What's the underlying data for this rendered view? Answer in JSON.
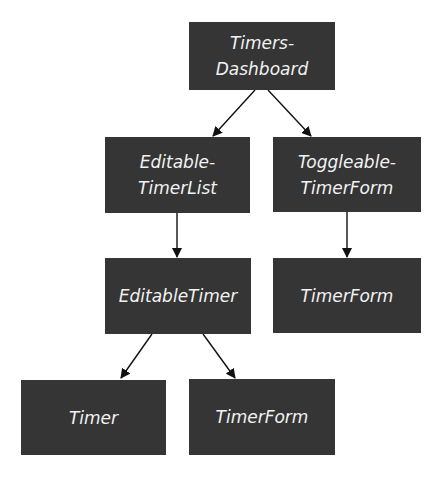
{
  "diagram": {
    "type": "component-hierarchy",
    "nodes": [
      {
        "id": "timers-dashboard",
        "lines": [
          "Timers-",
          "Dashboard"
        ]
      },
      {
        "id": "editable-timer-list",
        "lines": [
          "Editable-",
          "TimerList"
        ]
      },
      {
        "id": "toggleable-timer-form",
        "lines": [
          "Toggleable-",
          "TimerForm"
        ]
      },
      {
        "id": "editable-timer",
        "lines": [
          "EditableTimer"
        ]
      },
      {
        "id": "timer-form-top",
        "lines": [
          "TimerForm"
        ]
      },
      {
        "id": "timer",
        "lines": [
          "Timer"
        ]
      },
      {
        "id": "timer-form-bottom",
        "lines": [
          "TimerForm"
        ]
      }
    ],
    "edges": [
      {
        "from": "timers-dashboard",
        "to": "editable-timer-list"
      },
      {
        "from": "timers-dashboard",
        "to": "toggleable-timer-form"
      },
      {
        "from": "editable-timer-list",
        "to": "editable-timer"
      },
      {
        "from": "toggleable-timer-form",
        "to": "timer-form-top"
      },
      {
        "from": "editable-timer",
        "to": "timer"
      },
      {
        "from": "editable-timer",
        "to": "timer-form-bottom"
      }
    ],
    "colors": {
      "node_fill": "#353535",
      "node_text": "#f2f2f2",
      "edge": "#111111",
      "background": "#ffffff"
    }
  }
}
